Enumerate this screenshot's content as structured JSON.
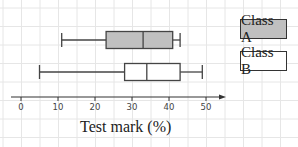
{
  "chart_data": {
    "type": "boxplot",
    "title": "",
    "xlabel": "Test mark (%)",
    "ylabel": "",
    "xlim": [
      0,
      55
    ],
    "x_ticks": [
      0,
      10,
      20,
      30,
      40,
      50
    ],
    "x_tick_labels": [
      "0",
      "10",
      "20",
      "30",
      "40",
      "50"
    ],
    "grid": true,
    "legend_position": "right",
    "series": [
      {
        "name": "Class A",
        "min": 11,
        "q1": 23,
        "median": 33,
        "q3": 41,
        "max": 43,
        "fill": "#c0c0c0"
      },
      {
        "name": "Class B",
        "min": 5,
        "q1": 28,
        "median": 34,
        "q3": 43,
        "max": 49,
        "fill": "#ffffff"
      }
    ]
  },
  "legend": {
    "items": [
      {
        "label": "Class A",
        "fill": "#c0c0c0"
      },
      {
        "label": "Class B",
        "fill": "#ffffff"
      }
    ]
  },
  "axis": {
    "label": "Test mark (%)"
  },
  "colors": {
    "grid": "#e6e6e6",
    "axis": "#333333",
    "box_stroke": "#444444"
  }
}
